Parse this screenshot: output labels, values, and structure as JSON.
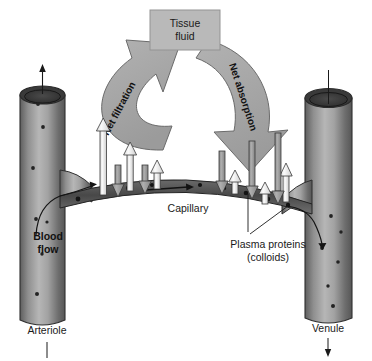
{
  "figure": {
    "title_box": {
      "line1": "Tissue",
      "line2": "fluid"
    },
    "arrows": {
      "filtration_label": "Net filtration",
      "absorption_label": "Net absorption"
    },
    "labels": {
      "capillary": "Capillary",
      "plasma_proteins_line1": "Plasma proteins",
      "plasma_proteins_line2": "(colloids)",
      "blood_flow_line1": "Blood",
      "blood_flow_line2": "flow",
      "arteriole": "Arteriole",
      "venule": "Venule"
    },
    "colors": {
      "background": "#ffffff",
      "vessel_light": "#b4b4b4",
      "vessel_mid": "#8c8c8c",
      "vessel_dark": "#4a4a4a",
      "vessel_outline": "#2b2b2b",
      "capillary_dark": "#4f4f4f",
      "big_arrow_fill": "#a8a8a8",
      "big_arrow_stroke": "#5a5a5a",
      "tissue_box_fill": "#b8b8b8",
      "tissue_box_stroke": "#8a8a8a",
      "white_arrow_fill": "#f2f2f2",
      "white_arrow_stroke": "#3a3a3a",
      "gray_arrow_fill": "#9a9a9a",
      "gray_arrow_stroke": "#3a3a3a",
      "text": "#1a1a1a",
      "protein_dot": "#1f1f1f"
    },
    "filtration_arrows": [
      {
        "x": 104,
        "top": 119,
        "width": 9
      },
      {
        "x": 131,
        "top": 143,
        "width": 9
      },
      {
        "x": 158,
        "top": 160,
        "width": 9
      },
      {
        "x": 236,
        "top": 170,
        "width": 8
      },
      {
        "x": 266,
        "top": 183,
        "width": 8
      },
      {
        "x": 287,
        "top": 163,
        "width": 8
      }
    ],
    "absorption_arrows": [
      {
        "x": 118,
        "top": 165,
        "width": 8
      },
      {
        "x": 145,
        "top": 165,
        "width": 8
      },
      {
        "x": 222,
        "top": 151,
        "width": 8
      },
      {
        "x": 252,
        "top": 141,
        "width": 8
      },
      {
        "x": 278,
        "top": 133,
        "width": 8
      }
    ],
    "protein_dots": [
      {
        "x": 78,
        "y": 196
      },
      {
        "x": 104,
        "y": 190
      },
      {
        "x": 128,
        "y": 186
      },
      {
        "x": 152,
        "y": 183
      },
      {
        "x": 176,
        "y": 182
      },
      {
        "x": 200,
        "y": 183
      },
      {
        "x": 224,
        "y": 186
      },
      {
        "x": 246,
        "y": 190
      },
      {
        "x": 266,
        "y": 196
      },
      {
        "x": 286,
        "y": 202
      }
    ],
    "vessel_dots_left": [
      {
        "x": 38,
        "y": 104
      },
      {
        "x": 43,
        "y": 127
      },
      {
        "x": 33,
        "y": 168
      },
      {
        "x": 36,
        "y": 219
      },
      {
        "x": 47,
        "y": 222
      },
      {
        "x": 42,
        "y": 254
      },
      {
        "x": 37,
        "y": 294
      }
    ],
    "vessel_dots_right": [
      {
        "x": 331,
        "y": 216
      },
      {
        "x": 341,
        "y": 232
      },
      {
        "x": 322,
        "y": 248
      },
      {
        "x": 338,
        "y": 262
      },
      {
        "x": 328,
        "y": 286
      },
      {
        "x": 333,
        "y": 306
      }
    ]
  }
}
